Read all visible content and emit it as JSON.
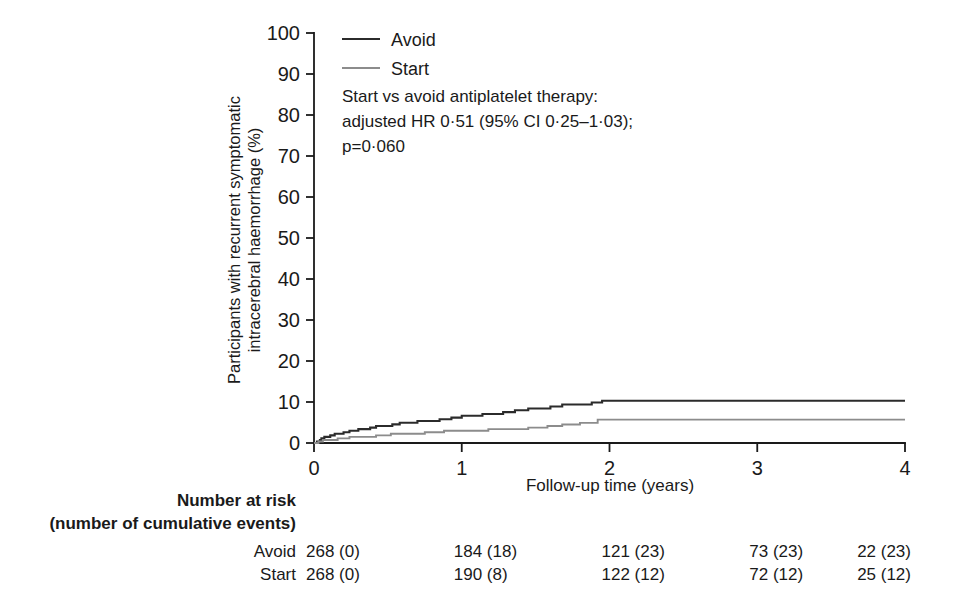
{
  "chart_data": {
    "type": "line",
    "subtype": "kaplan-meier-cumulative-incidence",
    "title": "",
    "xlabel": "Follow-up time (years)",
    "ylabel": "Participants with recurrent symptomatic intracerebral haemorrhage (%)",
    "ylabel_line1": "Participants with recurrent symptomatic",
    "ylabel_line2": "intracerebral haemorrhage (%)",
    "xlim": [
      0,
      4
    ],
    "ylim": [
      0,
      100
    ],
    "xticks": [
      0,
      1,
      2,
      3,
      4
    ],
    "xticklabels": [
      "0",
      "1",
      "2",
      "3",
      "4"
    ],
    "yticks": [
      0,
      10,
      20,
      30,
      40,
      50,
      60,
      70,
      80,
      90,
      100
    ],
    "yticklabels": [
      "0",
      "10",
      "20",
      "30",
      "40",
      "50",
      "60",
      "70",
      "80",
      "90",
      "100"
    ],
    "grid": false,
    "legend_position": "top-left-inside",
    "series": [
      {
        "name": "Avoid",
        "color": "#2b2b2b",
        "linewidth": 2.1,
        "x": [
          0,
          0.02,
          0.04,
          0.05,
          0.07,
          0.09,
          0.11,
          0.14,
          0.17,
          0.2,
          0.24,
          0.3,
          0.34,
          0.38,
          0.42,
          0.47,
          0.53,
          0.58,
          0.63,
          0.7,
          0.78,
          0.85,
          0.93,
          1.0,
          1.08,
          1.14,
          1.2,
          1.28,
          1.36,
          1.45,
          1.52,
          1.6,
          1.68,
          1.78,
          1.88,
          1.95,
          4.0
        ],
        "y": [
          0,
          0.38,
          0.75,
          1.12,
          1.5,
          1.5,
          1.87,
          2.24,
          2.24,
          2.61,
          3.0,
          3.38,
          3.38,
          3.76,
          4.15,
          4.15,
          4.55,
          4.95,
          4.95,
          5.36,
          5.36,
          5.78,
          6.2,
          6.63,
          6.63,
          7.07,
          7.07,
          7.52,
          7.97,
          8.43,
          8.43,
          8.9,
          9.38,
          9.38,
          9.87,
          10.3,
          10.3
        ]
      },
      {
        "name": "Start",
        "color": "#8c8c8c",
        "linewidth": 1.9,
        "x": [
          0,
          0.03,
          0.06,
          0.1,
          0.16,
          0.24,
          0.33,
          0.42,
          0.52,
          0.63,
          0.75,
          0.88,
          1.0,
          1.18,
          1.32,
          1.45,
          1.58,
          1.68,
          1.8,
          1.92,
          4.0
        ],
        "y": [
          0,
          0.38,
          0.75,
          0.75,
          1.12,
          1.5,
          1.5,
          1.87,
          2.25,
          2.25,
          2.62,
          3.0,
          3.0,
          3.38,
          3.38,
          3.76,
          4.15,
          4.53,
          4.92,
          5.7,
          5.7
        ]
      }
    ],
    "annotation": {
      "line1": "Start vs avoid antiplatelet therapy:",
      "line2": "adjusted HR 0·51 (95% CI 0·25–1·03);",
      "line3": "p=0·060"
    }
  },
  "legend": {
    "items": [
      {
        "label": "Avoid",
        "color": "#2b2b2b"
      },
      {
        "label": "Start",
        "color": "#8c8c8c"
      }
    ]
  },
  "risk_table": {
    "heading_line1": "Number at risk",
    "heading_line2": "(number of cumulative events)",
    "times": [
      0,
      1,
      2,
      3,
      4
    ],
    "rows": [
      {
        "label": "Avoid",
        "values": [
          "268 (0)",
          "184 (18)",
          "121 (23)",
          "73 (23)",
          "22 (23)"
        ]
      },
      {
        "label": "Start",
        "values": [
          "268 (0)",
          "190 (8)",
          "122 (12)",
          "72 (12)",
          "25 (12)"
        ]
      }
    ]
  },
  "colors": {
    "avoid": "#2b2b2b",
    "start": "#8c8c8c",
    "axis": "#1a1a1a",
    "background": "#ffffff"
  }
}
